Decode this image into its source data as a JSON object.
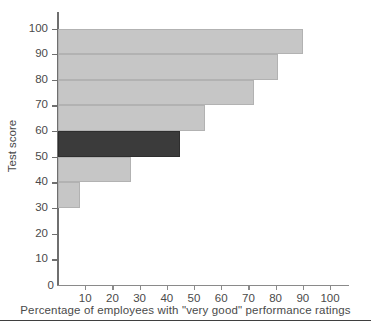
{
  "chart_data": {
    "type": "bar",
    "orientation": "horizontal",
    "title": "",
    "xlabel": "Percentage of employees with \"very good\" performance ratings",
    "ylabel": "Test score",
    "xlim": [
      0,
      108
    ],
    "ylim": [
      0,
      105
    ],
    "grid": false,
    "legend": "none",
    "xticks": [
      10,
      20,
      30,
      40,
      50,
      60,
      70,
      80,
      90,
      100
    ],
    "xtick_labels": [
      "10",
      "20",
      "30",
      "40",
      "50",
      "60",
      "70",
      "80",
      "90",
      "100"
    ],
    "yticks": [
      0,
      10,
      20,
      30,
      40,
      50,
      60,
      70,
      80,
      90,
      100
    ],
    "ytick_labels": [
      "0",
      "10",
      "20",
      "30",
      "40",
      "50",
      "60",
      "70",
      "80",
      "90",
      "100"
    ],
    "origin_label": "0",
    "colors": {
      "bar_light": "#c6c6c6",
      "bar_dark": "#3b3b3b",
      "axis": "#6f6f6f",
      "text": "#4a4a4a",
      "background": "#ffffff"
    },
    "categories": [
      "30-40",
      "40-50",
      "50-60",
      "60-70",
      "70-80",
      "80-90",
      "90-100"
    ],
    "bins": [
      {
        "label": "30-40",
        "y_low": 30,
        "y_high": 40,
        "value": 8,
        "highlight": false
      },
      {
        "label": "40-50",
        "y_low": 40,
        "y_high": 50,
        "value": 27,
        "highlight": false
      },
      {
        "label": "50-60",
        "y_low": 50,
        "y_high": 60,
        "value": 45,
        "highlight": true
      },
      {
        "label": "60-70",
        "y_low": 60,
        "y_high": 70,
        "value": 54,
        "highlight": false
      },
      {
        "label": "70-80",
        "y_low": 70,
        "y_high": 80,
        "value": 72,
        "highlight": false
      },
      {
        "label": "80-90",
        "y_low": 80,
        "y_high": 90,
        "value": 81,
        "highlight": false
      },
      {
        "label": "90-100",
        "y_low": 90,
        "y_high": 100,
        "value": 90,
        "highlight": false
      }
    ],
    "values": [
      8,
      27,
      45,
      54,
      72,
      81,
      90
    ]
  }
}
